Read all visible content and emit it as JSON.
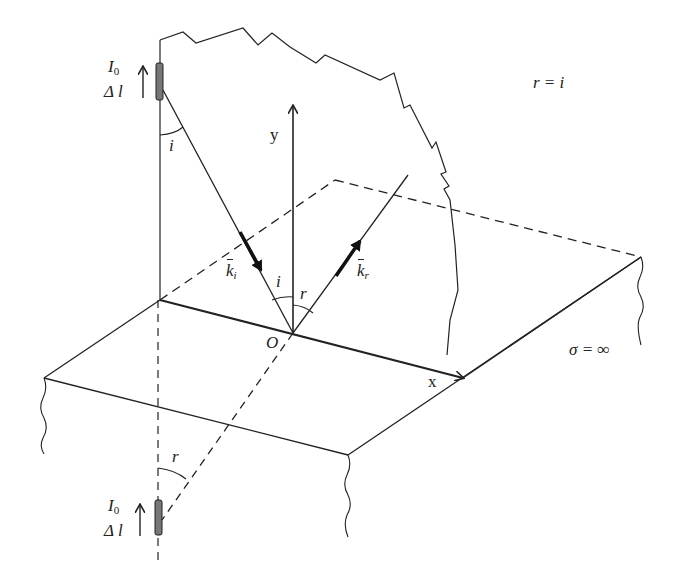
{
  "labels": {
    "source_current": "I",
    "source_current_sub": "0",
    "source_length": "Δ l",
    "image_current": "I",
    "image_current_sub": "0",
    "image_length": "Δ l",
    "y_axis": "y",
    "x_axis": "x",
    "origin": "O",
    "angle_incident": "i",
    "angle_incident_source": "i",
    "angle_reflected": "r",
    "angle_reflected_image": "r",
    "k_incident": "k",
    "k_incident_sub": "i",
    "k_reflected": "k",
    "k_reflected_sub": "r",
    "law": "r = i",
    "conductivity": "σ = ∞"
  },
  "colors": {
    "line": "#222222",
    "antenna_fill": "#777777",
    "background": "#ffffff"
  }
}
